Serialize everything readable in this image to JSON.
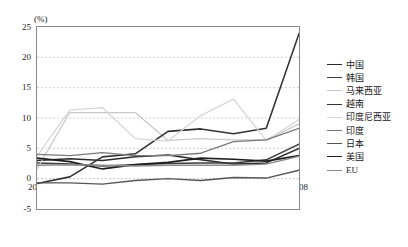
{
  "chart_data": {
    "type": "line",
    "title": "",
    "xlabel": "",
    "ylabel": "(%)",
    "unit_label": "(%)",
    "x": [
      2000,
      2001,
      2002,
      2003,
      2004,
      2005,
      2006,
      2007,
      2008
    ],
    "categories": [
      "2000",
      "2001",
      "2002",
      "2003",
      "2004",
      "2005",
      "2006",
      "2007",
      "2008"
    ],
    "xtick_labels": [
      "2000",
      "2001",
      "2002",
      "2003",
      "2004",
      "2005",
      "2006",
      "2007",
      "2008"
    ],
    "ytick_labels": [
      "25",
      "20",
      "15",
      "10",
      "5",
      "0",
      "-5"
    ],
    "ytick_values": [
      25,
      20,
      15,
      10,
      5,
      0,
      -5
    ],
    "ylim": [
      -5,
      25
    ],
    "xlim": [
      2000,
      2008
    ],
    "grid": "horizontal-dashed",
    "legend_position": "right",
    "series": [
      {
        "name": "中国",
        "color": "#2b2b2b",
        "width": 1.5,
        "values": [
          3.0,
          3.3,
          3.0,
          3.6,
          3.9,
          3.1,
          2.4,
          2.6,
          5.0
        ]
      },
      {
        "name": "韩国",
        "color": "#3d3d3d",
        "width": 1.5,
        "values": [
          2.6,
          2.4,
          2.1,
          2.3,
          2.5,
          2.6,
          2.6,
          3.1,
          5.7
        ]
      },
      {
        "name": "马来西亚",
        "color": "#c9c9c9",
        "width": 1.3,
        "values": [
          1.6,
          10.9,
          10.9,
          10.9,
          6.3,
          6.6,
          6.4,
          6.4,
          9.0
        ]
      },
      {
        "name": "越南",
        "color": "#333333",
        "width": 1.6,
        "values": [
          -0.8,
          0.3,
          3.6,
          4.1,
          7.8,
          8.2,
          7.4,
          8.3,
          23.9
        ]
      },
      {
        "name": "印度尼西亚",
        "color": "#d6d6d6",
        "width": 1.3,
        "values": [
          3.7,
          11.3,
          11.7,
          6.6,
          6.2,
          10.4,
          13.1,
          6.3,
          9.7
        ]
      },
      {
        "name": "印度",
        "color": "#7a7a7a",
        "width": 1.4,
        "values": [
          4.0,
          3.8,
          4.3,
          3.8,
          3.8,
          4.2,
          6.1,
          6.4,
          8.3
        ]
      },
      {
        "name": "日本",
        "color": "#555555",
        "width": 1.4,
        "values": [
          -0.7,
          -0.7,
          -0.9,
          -0.3,
          0.0,
          -0.3,
          0.2,
          0.1,
          1.4
        ]
      },
      {
        "name": "美国",
        "color": "#1f1f1f",
        "width": 1.7,
        "values": [
          3.4,
          2.8,
          1.6,
          2.3,
          2.7,
          3.4,
          3.2,
          2.9,
          3.8
        ]
      },
      {
        "name": "EU",
        "color": "#8c8c8c",
        "width": 1.4,
        "values": [
          2.2,
          2.3,
          2.2,
          2.1,
          2.2,
          2.2,
          2.2,
          2.4,
          3.7
        ]
      }
    ]
  },
  "legend": {
    "items": [
      {
        "label": "中国"
      },
      {
        "label": "韩国"
      },
      {
        "label": "马来西亚"
      },
      {
        "label": "越南"
      },
      {
        "label": "印度尼西亚"
      },
      {
        "label": "印度"
      },
      {
        "label": "日本"
      },
      {
        "label": "美国"
      },
      {
        "label": "EU"
      }
    ]
  }
}
